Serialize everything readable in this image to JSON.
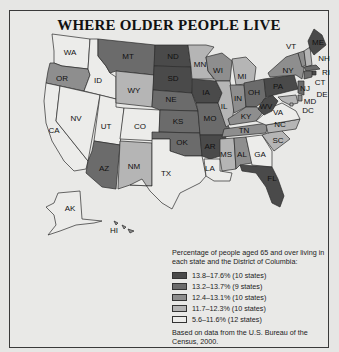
{
  "title": "WHERE OLDER PEOPLE LIVE",
  "legend": {
    "intro": "Percentage of people aged 65 and over living in each state and the District of Columbia:",
    "items": [
      {
        "label": "13.8–17.6% (10 states)",
        "color": "#4a4a4a"
      },
      {
        "label": "13.2–13.7% (9 states)",
        "color": "#6b6b6b"
      },
      {
        "label": "12.4–13.1% (10 states)",
        "color": "#8e8e8e"
      },
      {
        "label": "11.7–12.3% (10 states)",
        "color": "#b5b5b5"
      },
      {
        "label": "5.6–11.6% (12 states)",
        "color": "#ececea"
      }
    ],
    "source": "Based on data from the U.S. Bureau of the Census, 2000."
  },
  "states": {
    "WA": {
      "label": "WA",
      "tier": 4
    },
    "OR": {
      "label": "OR",
      "tier": 2
    },
    "CA": {
      "label": "CA",
      "tier": 4
    },
    "ID": {
      "label": "ID",
      "tier": 4
    },
    "NV": {
      "label": "NV",
      "tier": 4
    },
    "UT": {
      "label": "UT",
      "tier": 4
    },
    "AZ": {
      "label": "AZ",
      "tier": 1
    },
    "MT": {
      "label": "MT",
      "tier": 1
    },
    "WY": {
      "label": "WY",
      "tier": 3
    },
    "CO": {
      "label": "CO",
      "tier": 4
    },
    "NM": {
      "label": "NM",
      "tier": 3
    },
    "ND": {
      "label": "ND",
      "tier": 0
    },
    "SD": {
      "label": "SD",
      "tier": 0
    },
    "NE": {
      "label": "NE",
      "tier": 1
    },
    "KS": {
      "label": "KS",
      "tier": 1
    },
    "OK": {
      "label": "OK",
      "tier": 1
    },
    "TX": {
      "label": "TX",
      "tier": 4
    },
    "MN": {
      "label": "MN",
      "tier": 3
    },
    "IA": {
      "label": "IA",
      "tier": 0
    },
    "MO": {
      "label": "MO",
      "tier": 1
    },
    "AR": {
      "label": "AR",
      "tier": 0
    },
    "LA": {
      "label": "LA",
      "tier": 4
    },
    "WI": {
      "label": "WI",
      "tier": 2
    },
    "IL": {
      "label": "IL",
      "tier": 3
    },
    "MI": {
      "label": "MI",
      "tier": 3
    },
    "IN": {
      "label": "IN",
      "tier": 2
    },
    "OH": {
      "label": "OH",
      "tier": 1
    },
    "KY": {
      "label": "KY",
      "tier": 2
    },
    "TN": {
      "label": "TN",
      "tier": 2
    },
    "MS": {
      "label": "MS",
      "tier": 3
    },
    "AL": {
      "label": "AL",
      "tier": 2
    },
    "GA": {
      "label": "GA",
      "tier": 4
    },
    "FL": {
      "label": "FL",
      "tier": 0
    },
    "SC": {
      "label": "SC",
      "tier": 3
    },
    "NC": {
      "label": "NC",
      "tier": 3
    },
    "VA": {
      "label": "VA",
      "tier": 4
    },
    "WV": {
      "label": "WV",
      "tier": 0
    },
    "PA": {
      "label": "PA",
      "tier": 0
    },
    "NY": {
      "label": "NY",
      "tier": 2
    },
    "VT": {
      "label": "VT",
      "tier": 2
    },
    "NH": {
      "label": "NH",
      "tier": 3
    },
    "ME": {
      "label": "ME",
      "tier": 0
    },
    "MA": {
      "label": "MA",
      "tier": 1
    },
    "RI": {
      "label": "RI",
      "tier": 0
    },
    "CT": {
      "label": "CT",
      "tier": 1
    },
    "NJ": {
      "label": "NJ",
      "tier": 1
    },
    "DE": {
      "label": "DE",
      "tier": 2
    },
    "MD": {
      "label": "MD",
      "tier": 3
    },
    "DC": {
      "label": "DC",
      "tier": 3
    },
    "AK": {
      "label": "AK",
      "tier": 4
    },
    "HI": {
      "label": "HI",
      "tier": 2
    }
  }
}
